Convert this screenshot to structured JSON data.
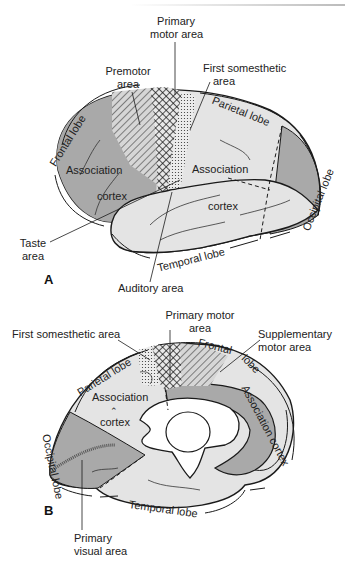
{
  "figure": {
    "panel_a": {
      "label": "A",
      "regions": {
        "primary_motor": [
          "Primary",
          "motor area"
        ],
        "premotor": [
          "Premotor",
          "area"
        ],
        "first_somesthetic": [
          "First somesthetic",
          "area"
        ],
        "parietal_lobe": "Parietal lobe",
        "frontal_lobe": "Frontal lobe",
        "association_frontal": "Association",
        "cortex_frontal": "cortex",
        "association_parietal": "Association",
        "cortex_temporal": "cortex",
        "occipital_lobe": "Occipital lobe",
        "taste": [
          "Taste",
          "area"
        ],
        "temporal_lobe": "Temporal lobe",
        "auditory": "Auditory area"
      }
    },
    "panel_b": {
      "label": "B",
      "regions": {
        "primary_motor": [
          "Primary motor",
          "area"
        ],
        "first_somesthetic": "First somesthetic area",
        "supplementary_motor": [
          "Supplementary",
          "motor area"
        ],
        "frontal_lobe": [
          "Frontal",
          "lobe"
        ],
        "parietal_lobe": "Parietal lobe",
        "association": "Association",
        "cortex": "cortex",
        "association_cortex": "Association cortex",
        "occipital_lobe": "Occipital lobe",
        "temporal_lobe": "Temporal lobe",
        "primary_visual": [
          "Primary",
          "visual area"
        ]
      }
    },
    "colors": {
      "dark_gray": "#a9a9a9",
      "light_gray": "#e4e4e4",
      "outline": "#1a1a1a"
    }
  }
}
